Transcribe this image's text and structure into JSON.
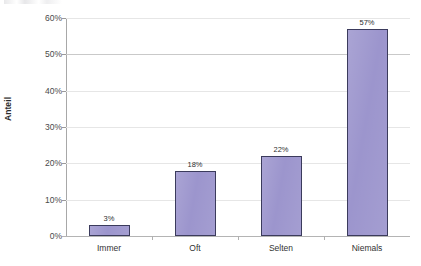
{
  "chart_data": {
    "type": "bar",
    "title": "",
    "subtitle": "",
    "xlabel": "",
    "ylabel": "Anteil",
    "categories": [
      "Immer",
      "Oft",
      "Selten",
      "Niemals"
    ],
    "values": [
      3,
      18,
      22,
      57
    ],
    "value_labels": [
      "3%",
      "18%",
      "22%",
      "57%"
    ],
    "ylim": [
      0,
      60
    ],
    "ytick_values": [
      0,
      10,
      20,
      30,
      40,
      50,
      60
    ],
    "ytick_labels": [
      "0%",
      "10%",
      "20%",
      "30%",
      "40%",
      "50%",
      "60%"
    ],
    "ytick_step": 10,
    "grid": true,
    "grid_axis": "y",
    "legend": false,
    "legend_position": "none",
    "series": [
      {
        "name": "Anteil",
        "values": [
          3,
          18,
          22,
          57
        ]
      }
    ],
    "colors": {
      "bar_fill": "#9a93cc",
      "bar_border": "#3b3b5c",
      "gridline": "#e6e6e6",
      "gridline_major": "#c9c9c9",
      "axis_line": "#b4b4b4",
      "text": "#333333",
      "background": "#ffffff"
    }
  }
}
